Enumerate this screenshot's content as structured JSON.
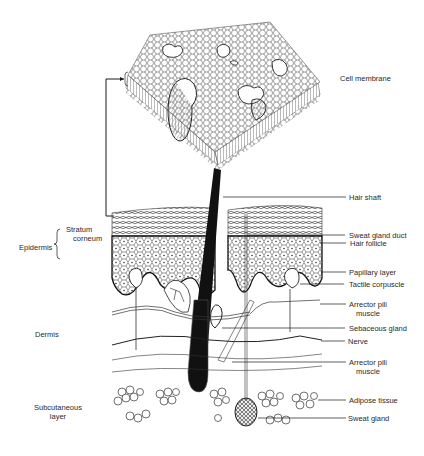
{
  "figure": {
    "type": "anatomical-diagram"
  },
  "labels_left": {
    "stratum_corneum_line1": "Stratum",
    "stratum_corneum_line2": "corneum",
    "epidermis": "Epidermis",
    "dermis": "Dermis",
    "subcutaneous_line1": "Subcutaneous",
    "subcutaneous_line2": "layer"
  },
  "labels_right": {
    "cell_membrane": "Cell membrane",
    "hair_shaft": "Hair shaft",
    "sweat_gland_duct": "Sweat gland duct",
    "hair_follicle": "Hair follicle",
    "papillary_layer": "Papillary layer",
    "tactile_corpuscle": "Tactile corpuscle",
    "arrector_pili_1_line1": "Arrector pili",
    "arrector_pili_1_line2": "muscle",
    "sebaceous_gland": "Sebaceous gland",
    "nerve": "Nerve",
    "arrector_pili_2_line1": "Arrector pili",
    "arrector_pili_2_line2": "muscle",
    "adipose_tissue": "Adipose tissue",
    "sweat_gland": "Sweat gland"
  },
  "colors": {
    "ink": "#1a1a1a",
    "background": "#ffffff",
    "shading": "#9a9a9a"
  }
}
